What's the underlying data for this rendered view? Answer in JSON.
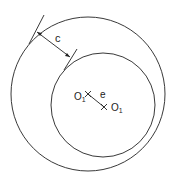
{
  "diagram": {
    "clearance_label": "c",
    "eccentricity_label": "e",
    "center_label_1": "O",
    "center_label_1_sub": "1",
    "center_label_2": "O",
    "center_label_2_sub": "1",
    "stroke_color": "#222222"
  }
}
